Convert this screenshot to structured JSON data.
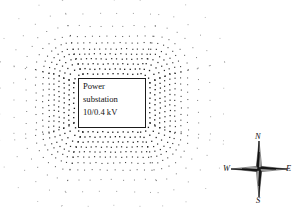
{
  "diagram": {
    "background_color": "#ffffff",
    "dot_color": "#1a1a1a",
    "line_color": "#1a1a1a"
  },
  "substation": {
    "line1": "Power",
    "line2": "substation",
    "line3": "10/0.4 kV",
    "box": {
      "x": 78,
      "y": 78,
      "width": 68,
      "height": 50
    }
  },
  "compass": {
    "north": "N",
    "east": "E",
    "south": "S",
    "west": "W",
    "center": {
      "x": 259,
      "y": 169
    }
  },
  "chart_data": {
    "type": "scatter",
    "xlabel": "",
    "ylabel": "",
    "xlim": [
      0,
      298
    ],
    "ylim": [
      0,
      211
    ],
    "grid": false,
    "legend": null,
    "contours": [
      {
        "name": "ring-1",
        "inset": 4,
        "corner_radius": 9,
        "spacing": 5.0,
        "dot_size": 1.3,
        "opacity": 1.0
      },
      {
        "name": "ring-2",
        "inset": 9,
        "corner_radius": 11,
        "spacing": 5.0,
        "dot_size": 1.3,
        "opacity": 1.0
      },
      {
        "name": "ring-3",
        "inset": 14,
        "corner_radius": 14,
        "spacing": 5.0,
        "dot_size": 1.25,
        "opacity": 0.98
      },
      {
        "name": "ring-4",
        "inset": 19,
        "corner_radius": 17,
        "spacing": 5.1,
        "dot_size": 1.2,
        "opacity": 0.95
      },
      {
        "name": "ring-5",
        "inset": 24,
        "corner_radius": 20,
        "spacing": 5.2,
        "dot_size": 1.2,
        "opacity": 0.92
      },
      {
        "name": "ring-6",
        "inset": 29,
        "corner_radius": 24,
        "spacing": 5.4,
        "dot_size": 1.15,
        "opacity": 0.88
      },
      {
        "name": "ring-7",
        "inset": 35,
        "corner_radius": 29,
        "spacing": 6.0,
        "dot_size": 1.1,
        "opacity": 0.82
      },
      {
        "name": "ring-8",
        "inset": 42,
        "corner_radius": 34,
        "spacing": 7.5,
        "dot_size": 1.05,
        "opacity": 0.7
      },
      {
        "name": "ring-9",
        "inset": 52,
        "corner_radius": 42,
        "spacing": 11.0,
        "dot_size": 1.0,
        "opacity": 0.55
      },
      {
        "name": "ring-10",
        "inset": 64,
        "corner_radius": 52,
        "spacing": 17.0,
        "dot_size": 1.0,
        "opacity": 0.42
      },
      {
        "name": "ring-11",
        "inset": 78,
        "corner_radius": 62,
        "spacing": 26.0,
        "dot_size": 1.0,
        "opacity": 0.3
      }
    ]
  }
}
